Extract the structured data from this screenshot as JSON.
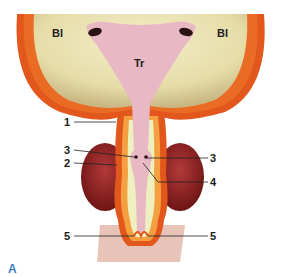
{
  "figure": {
    "panel_label": "A",
    "regions": {
      "bladder_left": "Bl",
      "bladder_right": "Bl",
      "trigone": "Tr"
    },
    "callouts": [
      {
        "id": "1",
        "side": "left"
      },
      {
        "id": "3",
        "side": "left"
      },
      {
        "id": "2",
        "side": "left"
      },
      {
        "id": "3",
        "side": "right"
      },
      {
        "id": "4",
        "side": "right"
      },
      {
        "id": "5",
        "side": "left"
      },
      {
        "id": "5",
        "side": "right"
      }
    ],
    "colors": {
      "bladder_lumen": "#e9e3b4",
      "muscle_wall": "#e2571c",
      "trigone": "#e8b9c4",
      "gland": "#8a1e1e",
      "urethra_lumen": "#eef0c0",
      "panel_label": "#3f7fbf"
    }
  }
}
